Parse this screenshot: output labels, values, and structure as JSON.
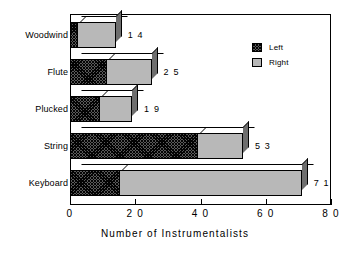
{
  "chart_data": {
    "type": "bar",
    "orientation": "horizontal",
    "stacked": true,
    "title": "",
    "xlabel": "Number  of  Instrumentalists",
    "ylabel": "",
    "xlim": [
      0,
      80
    ],
    "xticks": [
      0,
      20,
      40,
      60,
      80
    ],
    "xticklabels": [
      "0",
      "2 0",
      "4 0",
      "6 0",
      "8 0"
    ],
    "grid": false,
    "categories": [
      "Woodwind",
      "Flute",
      "Plucked",
      "String",
      "Keyboard"
    ],
    "series": [
      {
        "name": "Left",
        "color": "#5a5a5a",
        "pattern": "cross-hatch",
        "values": [
          2,
          11,
          9,
          39,
          15
        ]
      },
      {
        "name": "Right",
        "color": "#b8b8b8",
        "pattern": "solid",
        "values": [
          12,
          14,
          10,
          14,
          56
        ]
      }
    ],
    "totals": [
      14,
      25,
      19,
      53,
      71
    ],
    "bar_labels": [
      "1 4",
      "2 5",
      "1 9",
      "5 3",
      "7 1"
    ],
    "legend": {
      "position": "top-right",
      "entries": [
        {
          "label": "Left",
          "swatch": "hatched-dark"
        },
        {
          "label": "Right",
          "swatch": "solid-gray"
        }
      ]
    }
  },
  "axis": {
    "x_title": "Number  of  Instrumentalists",
    "ticks": [
      {
        "value": 0,
        "label": "0"
      },
      {
        "value": 20,
        "label": "2 0"
      },
      {
        "value": 40,
        "label": "4 0"
      },
      {
        "value": 60,
        "label": "6 0"
      },
      {
        "value": 80,
        "label": "8 0"
      }
    ]
  },
  "categories": [
    {
      "label": "Woodwind",
      "left": 2,
      "right": 12,
      "total_label": "1 4"
    },
    {
      "label": "Flute",
      "left": 11,
      "right": 14,
      "total_label": "2 5"
    },
    {
      "label": "Plucked",
      "left": 9,
      "right": 10,
      "total_label": "1 9"
    },
    {
      "label": "String",
      "left": 39,
      "right": 14,
      "total_label": "5 3"
    },
    {
      "label": "Keyboard",
      "left": 15,
      "right": 56,
      "total_label": "7 1"
    }
  ],
  "legend": {
    "items": [
      {
        "label": "Left"
      },
      {
        "label": "Right"
      }
    ]
  },
  "colors": {
    "left_fill": "#5a5a5a",
    "right_fill": "#b8b8b8",
    "side_face": "#6e6e6e",
    "top_face": "#ffffff",
    "outline": "#000000",
    "background": "#ffffff"
  }
}
